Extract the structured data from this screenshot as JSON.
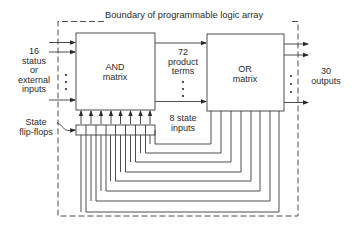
{
  "diagram": {
    "boundary_label": "Boundary of programmable logic array",
    "and_matrix": {
      "line1": "AND",
      "line2": "matrix"
    },
    "or_matrix": {
      "line1": "OR",
      "line2": "matrix"
    },
    "inputs_label": {
      "l1": "16",
      "l2": "status",
      "l3": "or",
      "l4": "external",
      "l5": "inputs"
    },
    "product_terms_label": {
      "l1": "72",
      "l2": "product",
      "l3": "terms"
    },
    "state_inputs_label": {
      "l1": "8 state",
      "l2": "inputs"
    },
    "outputs_label": {
      "l1": "30",
      "l2": "outputs"
    },
    "flipflops_label": {
      "l1": "State",
      "l2": "flip-flops"
    },
    "flipflop_count": 8,
    "colors": {
      "line": "#3a3a3a",
      "background": "#ffffff"
    }
  }
}
